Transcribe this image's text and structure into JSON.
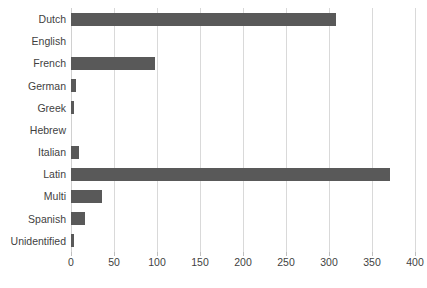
{
  "chart_data": {
    "type": "bar",
    "orientation": "horizontal",
    "title": "",
    "subtitle": "",
    "xlabel": "",
    "ylabel": "",
    "xlim": [
      0,
      400
    ],
    "xticks": [
      0,
      50,
      100,
      150,
      200,
      250,
      300,
      350,
      400
    ],
    "xtick_labels": [
      "0",
      "50",
      "100",
      "150",
      "200",
      "250",
      "300",
      "350",
      "400"
    ],
    "grid": true,
    "legend": false,
    "legend_position": "none",
    "bar_color": "#595959",
    "gridline_color": "#D9D9D9",
    "text_color": "#3F3F3F",
    "categories": [
      "Dutch",
      "English",
      "French",
      "German",
      "Greek",
      "Hebrew",
      "Italian",
      "Latin",
      "Multi",
      "Spanish",
      "Unidentified"
    ],
    "values": [
      308,
      0,
      98,
      6,
      3,
      0,
      9,
      371,
      36,
      16,
      3
    ]
  }
}
